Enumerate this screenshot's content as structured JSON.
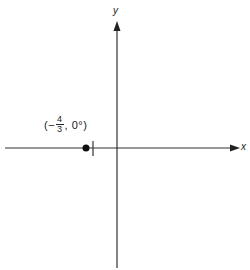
{
  "diagram": {
    "axes": {
      "x_label": "x",
      "y_label": "y",
      "color": "#333333"
    },
    "point": {
      "label_open": "(−",
      "fraction_numerator": "4",
      "fraction_denominator": "3",
      "label_close": ", 0°)",
      "r": "-4/3",
      "theta": "0°"
    }
  }
}
